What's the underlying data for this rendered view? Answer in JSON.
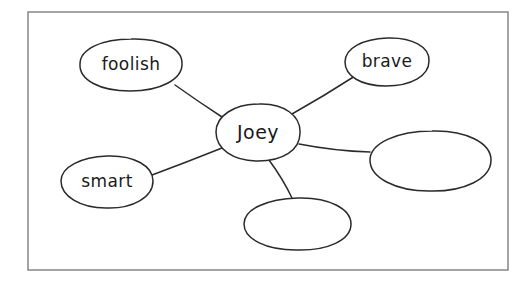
{
  "diagram": {
    "kind": "word-web",
    "frame": {
      "x": 28,
      "y": 12,
      "width": 480,
      "height": 258,
      "stroke_color": "#8d8d8d"
    },
    "style": {
      "background_color": "#ffffff",
      "ink_color": "#2b2b2b",
      "text_color": "#1a1a1a"
    },
    "center": {
      "id": "center",
      "label": "Joey",
      "cx": 258,
      "cy": 132,
      "rx": 42,
      "ry": 28
    },
    "nodes": [
      {
        "id": "foolish",
        "label": "foolish",
        "cx": 131,
        "cy": 65,
        "rx": 51,
        "ry": 26,
        "empty": false
      },
      {
        "id": "brave",
        "label": "brave",
        "cx": 387,
        "cy": 62,
        "rx": 42,
        "ry": 24,
        "empty": false
      },
      {
        "id": "smart",
        "label": "smart",
        "cx": 107,
        "cy": 182,
        "rx": 46,
        "ry": 26,
        "empty": false
      },
      {
        "id": "blank-right",
        "label": "",
        "cx": 430,
        "cy": 161,
        "rx": 61,
        "ry": 30,
        "empty": true
      },
      {
        "id": "blank-bottom",
        "label": "",
        "cx": 297,
        "cy": 224,
        "rx": 54,
        "ry": 26,
        "empty": true
      }
    ],
    "connections": [
      {
        "id": "center-to-foolish",
        "from": "center",
        "to": "foolish",
        "x1": 222,
        "y1": 117,
        "x2": 175,
        "y2": 85
      },
      {
        "id": "center-to-brave",
        "from": "center",
        "to": "brave",
        "x1": 292,
        "y1": 114,
        "x2": 355,
        "y2": 76
      },
      {
        "id": "center-to-smart",
        "from": "center",
        "to": "smart",
        "x1": 222,
        "y1": 148,
        "x2": 152,
        "y2": 175
      },
      {
        "id": "center-to-blank-right",
        "from": "center",
        "to": "blank-right",
        "x1": 299,
        "y1": 144,
        "x2": 370,
        "y2": 152
      },
      {
        "id": "center-to-blank-bottom",
        "from": "center",
        "to": "blank-bottom",
        "x1": 269,
        "y1": 160,
        "x2": 292,
        "y2": 198
      }
    ]
  }
}
